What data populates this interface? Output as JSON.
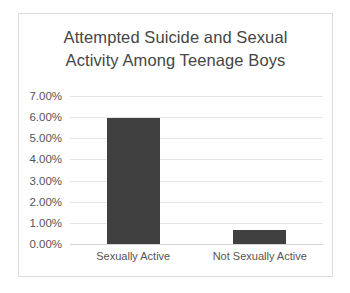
{
  "chart_data": {
    "type": "bar",
    "title": "Attempted Suicide and Sexual\nActivity Among Teenage Boys",
    "title_line1": "Attempted Suicide and Sexual",
    "title_line2": "Activity Among Teenage Boys",
    "xlabel": "",
    "ylabel": "",
    "categories": [
      "Sexually Active",
      "Not Sexually Active"
    ],
    "values": [
      0.0595,
      0.0066
    ],
    "value_labels": [
      "5.95%",
      "0.66%"
    ],
    "ylim": [
      0,
      0.07
    ],
    "ytick_values": [
      0.07,
      0.06,
      0.05,
      0.04,
      0.03,
      0.02,
      0.01,
      0
    ],
    "ytick_labels": [
      "7.00%",
      "6.00%",
      "5.00%",
      "4.00%",
      "3.00%",
      "2.00%",
      "1.00%",
      "0.00%"
    ],
    "grid": true,
    "grid_axis": "y",
    "legend": false,
    "legend_position": "none",
    "bar_color": "#404040",
    "grid_color": "#e4e4e4",
    "axis_color": "#d5d5d5",
    "text_color": "#555555",
    "title_color": "#464646",
    "background": "#ffffff",
    "border_color": "#dcdcdc"
  }
}
